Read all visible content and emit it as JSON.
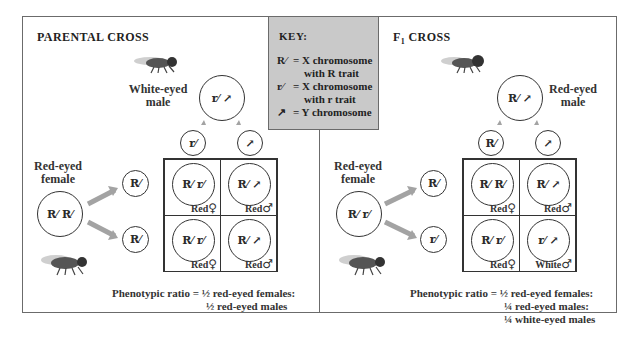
{
  "key": {
    "title": "KEY:",
    "rows": [
      {
        "symbol": "R⁄",
        "eq": "= X chromosome",
        "cont": "with R trait"
      },
      {
        "symbol": "r⁄",
        "eq": "= X chromosome",
        "cont": "with r trait"
      },
      {
        "symbol": "↗",
        "eq": "= Y chromosome"
      }
    ]
  },
  "parental": {
    "title": "PARENTAL CROSS",
    "male_label": [
      "White-eyed",
      "male"
    ],
    "male_genotype": "r⁄ ↗",
    "female_label": [
      "Red-eyed",
      "female"
    ],
    "female_genotype": "R⁄ R⁄",
    "male_gametes": [
      "r⁄",
      "↗"
    ],
    "female_gametes": [
      "R⁄",
      "R⁄"
    ],
    "cells": [
      {
        "genotype": "R⁄ r⁄",
        "phenotype": "Red",
        "sex": "♀"
      },
      {
        "genotype": "R⁄ ↗",
        "phenotype": "Red",
        "sex": "♂"
      },
      {
        "genotype": "R⁄ r⁄",
        "phenotype": "Red",
        "sex": "♀"
      },
      {
        "genotype": "R⁄ ↗",
        "phenotype": "Red",
        "sex": "♂"
      }
    ],
    "ratio_prefix": "Phenotypic ratio =",
    "ratio_lines": [
      "½ red-eyed females:",
      "½ red-eyed males"
    ]
  },
  "f1": {
    "title_main": "F",
    "title_sub": "1",
    "title_rest": " CROSS",
    "male_label": [
      "Red-eyed",
      "male"
    ],
    "male_genotype": "R⁄ ↗",
    "female_label": [
      "Red-eyed",
      "female"
    ],
    "female_genotype": "R⁄ r⁄",
    "male_gametes": [
      "R⁄",
      "↗"
    ],
    "female_gametes": [
      "R⁄",
      "r⁄"
    ],
    "cells": [
      {
        "genotype": "R⁄ R⁄",
        "phenotype": "Red",
        "sex": "♀"
      },
      {
        "genotype": "R⁄ ↗",
        "phenotype": "Red",
        "sex": "♂"
      },
      {
        "genotype": "R⁄ r⁄",
        "phenotype": "Red",
        "sex": "♀"
      },
      {
        "genotype": "r⁄ ↗",
        "phenotype": "White",
        "sex": "♂"
      }
    ],
    "ratio_prefix": "Phenotypic ratio =",
    "ratio_lines": [
      "½ red-eyed females:",
      "¼ red-eyed males:",
      "¼ white-eyed males"
    ]
  },
  "colors": {
    "arrow": "#a3a3a3",
    "key_bg": "#c9c9c9",
    "line": "#6b6b6b"
  }
}
